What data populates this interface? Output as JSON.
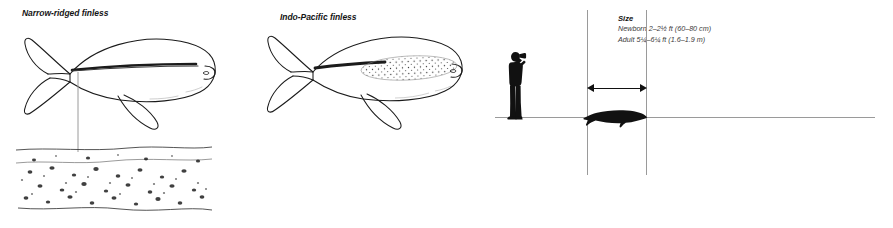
{
  "page": {
    "background": "#ffffff",
    "line_color": "#9a9a9a",
    "ink_color": "#111111",
    "width": 893,
    "height": 228
  },
  "species_panels": [
    {
      "id": "narrow-ridged-finless",
      "caption": "Narrow-ridged finless",
      "marking": "narrow dorsal ridge",
      "detail_callout": "dorsal ridge tubercle field"
    },
    {
      "id": "indo-pacific-finless",
      "caption": "Indo-Pacific finless",
      "marking": "broad stippled dorsal patch"
    }
  ],
  "size_panel": {
    "title": "Size",
    "rows": [
      {
        "label": "Newborn",
        "value": "2–2½ ft (60–80 cm)"
      },
      {
        "label": "Adult",
        "value": "5¼–6¼ ft (1.6–1.9 m)"
      }
    ],
    "human_figure": "observer-with-binoculars",
    "animal_silhouette": "finless-porpoise-silhouette",
    "measure_arrow": "double-headed-length-arrow"
  }
}
